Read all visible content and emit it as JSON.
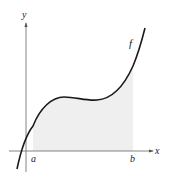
{
  "figure": {
    "axes": {
      "x_label": "x",
      "y_label": "y"
    },
    "function_label": "f",
    "bounds": {
      "lower": "a",
      "upper": "b"
    },
    "colors": {
      "curve": "#1a1a1a",
      "axes": "#555555",
      "shading": "#eeeeee"
    }
  }
}
